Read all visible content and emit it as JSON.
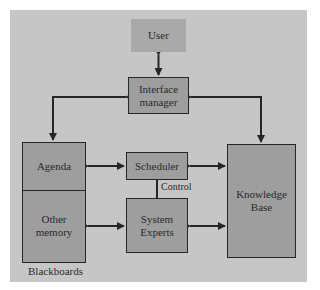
{
  "diagram": {
    "nodes": {
      "user": {
        "label": "User"
      },
      "interface_manager": {
        "label_line1": "Interface",
        "label_line2": "manager"
      },
      "agenda": {
        "label": "Agenda"
      },
      "other_memory": {
        "label_line1": "Other",
        "label_line2": "memory"
      },
      "scheduler": {
        "label": "Scheduler"
      },
      "system_experts": {
        "label_line1": "System",
        "label_line2": "Experts"
      },
      "knowledge_base": {
        "label_line1": "Knowledge",
        "label_line2": "Base"
      }
    },
    "labels": {
      "control": "Control",
      "blackboards": "Blackboards"
    },
    "edges": [
      {
        "from": "user",
        "to": "interface_manager",
        "type": "bidirectional"
      },
      {
        "from": "interface_manager",
        "to": "agenda",
        "type": "bidirectional"
      },
      {
        "from": "interface_manager",
        "to": "knowledge_base",
        "type": "bidirectional"
      },
      {
        "from": "agenda",
        "to": "scheduler",
        "type": "bidirectional"
      },
      {
        "from": "scheduler",
        "to": "knowledge_base",
        "type": "bidirectional"
      },
      {
        "from": "scheduler",
        "to": "system_experts",
        "type": "line",
        "label": "Control"
      },
      {
        "from": "other_memory",
        "to": "system_experts",
        "type": "bidirectional"
      },
      {
        "from": "system_experts",
        "to": "knowledge_base",
        "type": "bidirectional"
      }
    ],
    "colors": {
      "panel": "#c6c6c6",
      "box": "#9e9e9e",
      "user_box": "#a9a9a9",
      "stroke": "#262626"
    }
  }
}
